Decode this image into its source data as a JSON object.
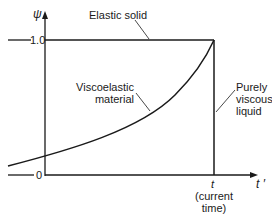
{
  "diagram": {
    "y_axis": {
      "label": "ψ",
      "ticks": [
        "1.0",
        "0"
      ]
    },
    "x_axis": {
      "label": "t ′",
      "marker": "t",
      "marker_note_line1": "(current",
      "marker_note_line2": "time)"
    },
    "curves": {
      "elastic": "Elastic solid",
      "viscoelastic_line1": "Viscoelastic",
      "viscoelastic_line2": "material",
      "viscous_line1": "Purely",
      "viscous_line2": "viscous",
      "viscous_line3": "liquid"
    },
    "colors": {
      "line": "#1a1a1a",
      "background": "#ffffff"
    }
  }
}
